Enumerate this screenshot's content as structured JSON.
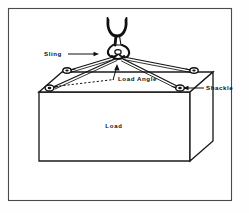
{
  "figure": {
    "background_color": "#fefefe",
    "ink_color": "#111111",
    "frame_color": "#4a4a4a"
  },
  "labels": {
    "sling": "Sling",
    "load_angle": "Load Angle",
    "shackle": "Shackle",
    "load": "Load"
  },
  "components": {
    "hook": "crane-hook",
    "master_link": "master-link",
    "sling_legs": 4,
    "shackles": 4,
    "load_body": "rectangular-box"
  },
  "geometry": {
    "frame": {
      "x": 8,
      "y": 8,
      "width": 224,
      "height": 193
    },
    "apex": {
      "x": 118,
      "y": 52
    },
    "hook_top": {
      "x": 116,
      "y": 19
    },
    "box_top_front_left": {
      "x": 39,
      "y": 92
    },
    "box_top_front_right": {
      "x": 190,
      "y": 92
    },
    "box_bottom_front_left": {
      "x": 39,
      "y": 161
    },
    "box_bottom_front_right": {
      "x": 190,
      "y": 161
    },
    "box_top_back_left": {
      "x": 62,
      "y": 72
    },
    "box_top_back_right": {
      "x": 213,
      "y": 72
    },
    "box_bottom_back_right": {
      "x": 213,
      "y": 141
    },
    "shackle_front_left": {
      "x": 50,
      "y": 88
    },
    "shackle_front_right": {
      "x": 178,
      "y": 88
    },
    "shackle_back_left": {
      "x": 68,
      "y": 70
    },
    "shackle_back_right": {
      "x": 193,
      "y": 70
    },
    "dashed_ref_start": {
      "x": 55,
      "y": 86
    },
    "dashed_ref_end": {
      "x": 112,
      "y": 80
    }
  },
  "annotations": {
    "sling_leader": {
      "from_x": 68,
      "from_y": 54,
      "to_x": 98,
      "to_y": 54
    },
    "shackle_leader": {
      "from_x": 196,
      "from_y": 88,
      "to_x": 206,
      "to_y": 88
    },
    "angle_marker": "load-angle-vertex-arrow"
  }
}
